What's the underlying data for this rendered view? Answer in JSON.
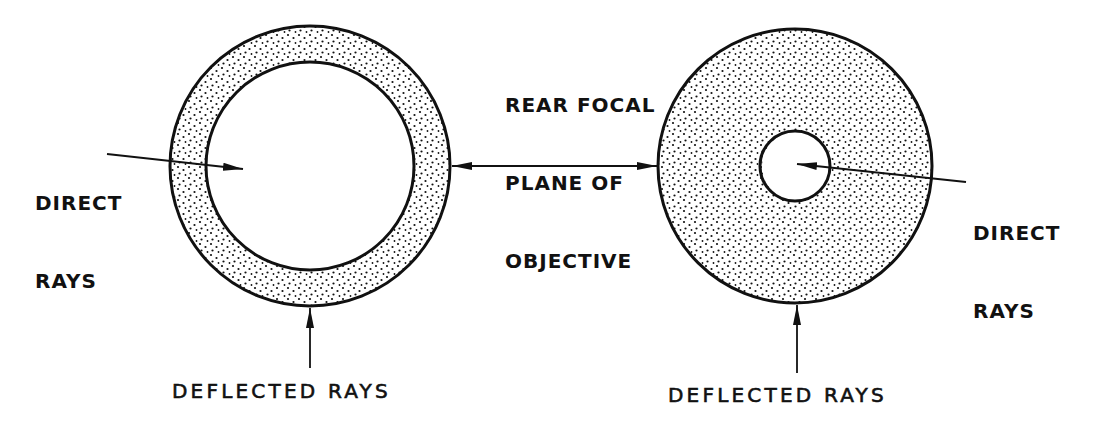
{
  "diagram": {
    "labels": {
      "left_direct": [
        "DIRECT",
        "RAYS"
      ],
      "right_direct": [
        "DIRECT",
        "RAYS"
      ],
      "focal_plane": [
        "REAR FOCAL",
        "PLANE OF",
        "OBJECTIVE"
      ],
      "left_deflected": "DEFLECTED RAYS",
      "right_deflected": "DEFLECTED RAYS"
    },
    "shapes": {
      "left_annulus": {
        "cx": 310,
        "cy": 166,
        "outer_r": 140,
        "inner_r": 104,
        "fill": "stippled ring, clear center"
      },
      "right_disk": {
        "cx": 795,
        "cy": 166,
        "outer_r": 137,
        "inner_r": 35,
        "fill": "stippled disk, clear small center"
      }
    },
    "colors": {
      "ink": "#111111",
      "background": "#ffffff"
    }
  }
}
